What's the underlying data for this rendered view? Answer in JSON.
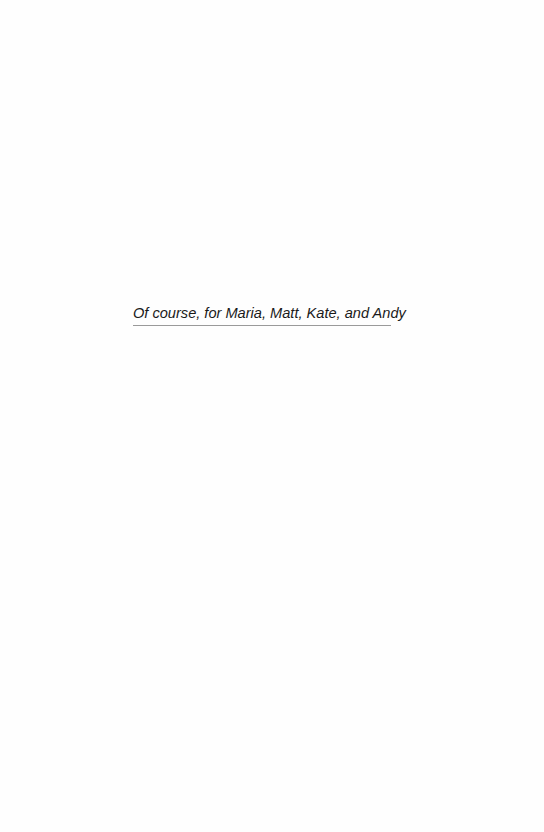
{
  "page": {
    "background": "#ffffff"
  },
  "dedication": {
    "text": "Of course, for Maria, Matt, Kate, and Andy",
    "text_color": "#1a1a1a",
    "rule_color": "#9a9a9a"
  }
}
